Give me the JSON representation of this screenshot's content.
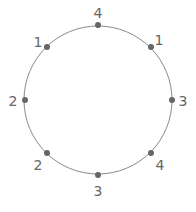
{
  "diagram": {
    "center": [
      98,
      100
    ],
    "radius": 74,
    "stroke_color": "#8a8a8a",
    "dot_color": "#666666",
    "points": [
      {
        "position": "top",
        "angle": -90,
        "label": "4"
      },
      {
        "position": "top-right",
        "angle": -45,
        "label": "1"
      },
      {
        "position": "right",
        "angle": 0,
        "label": "3"
      },
      {
        "position": "bottom-right",
        "angle": 45,
        "label": "4"
      },
      {
        "position": "bottom",
        "angle": 90,
        "label": "3"
      },
      {
        "position": "bottom-left",
        "angle": 135,
        "label": "2"
      },
      {
        "position": "left",
        "angle": 180,
        "label": "2"
      },
      {
        "position": "top-left",
        "angle": 225,
        "label": "1"
      }
    ]
  }
}
